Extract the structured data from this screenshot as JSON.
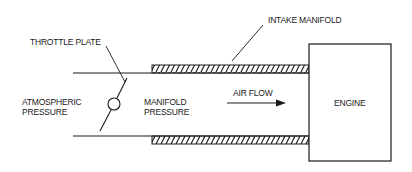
{
  "diagram": {
    "labels": {
      "throttle_plate": "THROTTLE PLATE",
      "intake_manifold": "INTAKE MANIFOLD",
      "atmospheric_1": "ATMOSPHERIC",
      "atmospheric_2": "PRESSURE",
      "manifold_1": "MANIFOLD",
      "manifold_2": "PRESSURE",
      "air_flow": "AIR FLOW",
      "engine": "ENGINE"
    },
    "colors": {
      "stroke": "#1a1a1a",
      "background": "#ffffff"
    }
  }
}
